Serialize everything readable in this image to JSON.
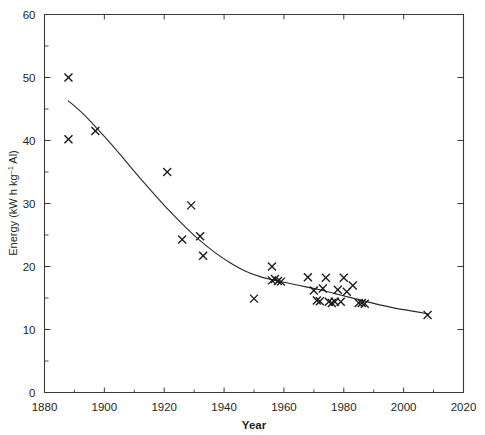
{
  "chart_data": {
    "type": "scatter",
    "title": "",
    "xlabel": "Year",
    "ylabel": "Energy (kW h kg⁻¹ Al)",
    "ylabel_parts": {
      "prefix": "Energy (kW h kg",
      "exponent": "–1",
      "suffix": " Al)"
    },
    "xlim": [
      1880,
      2020
    ],
    "ylim": [
      0,
      60
    ],
    "xticks": [
      1880,
      1900,
      1920,
      1940,
      1960,
      1980,
      2000,
      2020
    ],
    "xtick_labels": [
      "1880",
      "1900",
      "1920",
      "1940",
      "1960",
      "1980",
      "2000",
      "2020"
    ],
    "xminor_step": 10,
    "yticks": [
      0,
      10,
      20,
      30,
      40,
      50,
      60
    ],
    "ytick_labels": [
      "0",
      "10",
      "20",
      "30",
      "40",
      "50",
      "60"
    ],
    "yminor_step": 5,
    "grid": false,
    "legend": null,
    "marker_symbol": "x",
    "marker_size": 8,
    "series": [
      {
        "name": "Smelting energy per kg Al",
        "marker": "x",
        "points": [
          [
            1888,
            50.0
          ],
          [
            1888,
            40.2
          ],
          [
            1897,
            41.5
          ],
          [
            1921,
            35.0
          ],
          [
            1926,
            24.3
          ],
          [
            1929,
            29.7
          ],
          [
            1932,
            24.8
          ],
          [
            1933,
            21.7
          ],
          [
            1950,
            14.9
          ],
          [
            1956,
            20.0
          ],
          [
            1956,
            17.8
          ],
          [
            1957,
            18.0
          ],
          [
            1958,
            17.7
          ],
          [
            1959,
            17.6
          ],
          [
            1968,
            18.3
          ],
          [
            1970,
            16.2
          ],
          [
            1971,
            14.6
          ],
          [
            1972,
            14.5
          ],
          [
            1973,
            16.5
          ],
          [
            1974,
            18.2
          ],
          [
            1975,
            14.4
          ],
          [
            1976,
            14.2
          ],
          [
            1977,
            14.4
          ],
          [
            1978,
            16.3
          ],
          [
            1979,
            14.4
          ],
          [
            1980,
            18.2
          ],
          [
            1981,
            16.0
          ],
          [
            1983,
            17.0
          ],
          [
            1985,
            14.2
          ],
          [
            1986,
            14.2
          ],
          [
            1987,
            14.1
          ],
          [
            2008,
            12.3
          ]
        ]
      }
    ],
    "fit_curve": {
      "name": "fitted decay trend",
      "points": [
        [
          1888,
          46.3
        ],
        [
          1893,
          44.2
        ],
        [
          1897,
          42.2
        ],
        [
          1902,
          39.6
        ],
        [
          1907,
          36.8
        ],
        [
          1912,
          34.0
        ],
        [
          1917,
          31.3
        ],
        [
          1922,
          28.7
        ],
        [
          1927,
          26.3
        ],
        [
          1932,
          24.1
        ],
        [
          1937,
          22.2
        ],
        [
          1942,
          20.6
        ],
        [
          1947,
          19.3
        ],
        [
          1952,
          18.4
        ],
        [
          1957,
          17.8
        ],
        [
          1962,
          17.3
        ],
        [
          1967,
          16.8
        ],
        [
          1972,
          16.3
        ],
        [
          1977,
          15.7
        ],
        [
          1982,
          15.1
        ],
        [
          1987,
          14.5
        ],
        [
          1992,
          13.9
        ],
        [
          1997,
          13.4
        ],
        [
          2002,
          13.0
        ],
        [
          2008,
          12.5
        ]
      ]
    },
    "colors": {
      "axis": "#3a3a3a",
      "marker": "#1a1a1a",
      "curve": "#2b2b2b",
      "background": "#ffffff",
      "text": "#231f20"
    }
  }
}
